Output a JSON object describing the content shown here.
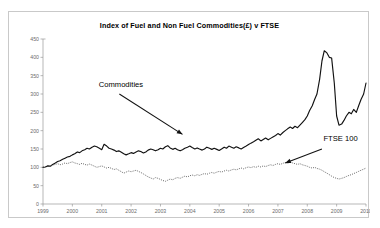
{
  "card": {
    "border_color": "#c9c9c9",
    "background": "#ffffff"
  },
  "chart_data": {
    "type": "line",
    "title": "Index of Fuel and Non Fuel Commodities(£) v FTSE",
    "xlabel": "",
    "ylabel": "",
    "grid": false,
    "legend_position": "inline-annotations",
    "xlim": [
      1999,
      2010
    ],
    "ylim": [
      0,
      450
    ],
    "ytick_step": 50,
    "yticks": [
      0,
      50,
      100,
      150,
      200,
      250,
      300,
      350,
      400,
      450
    ],
    "xticks": [
      1999,
      2000,
      2001,
      2002,
      2003,
      2004,
      2005,
      2006,
      2007,
      2008,
      2009,
      2010
    ],
    "annotations": [
      {
        "text": "Commodities",
        "target_series": "Commodities",
        "arrow": "down-right"
      },
      {
        "text": "FTSE 100",
        "target_series": "FTSE 100",
        "arrow": "down-left"
      }
    ],
    "series": [
      {
        "name": "Commodities",
        "style": "solid",
        "color": "#121212",
        "x": [
          1999.0,
          1999.08,
          1999.17,
          1999.25,
          1999.33,
          1999.42,
          1999.5,
          1999.58,
          1999.67,
          1999.75,
          1999.83,
          1999.92,
          2000.0,
          2000.08,
          2000.17,
          2000.25,
          2000.33,
          2000.42,
          2000.5,
          2000.58,
          2000.67,
          2000.75,
          2000.83,
          2000.92,
          2001.0,
          2001.08,
          2001.17,
          2001.25,
          2001.33,
          2001.42,
          2001.5,
          2001.58,
          2001.67,
          2001.75,
          2001.83,
          2001.92,
          2002.0,
          2002.08,
          2002.17,
          2002.25,
          2002.33,
          2002.42,
          2002.5,
          2002.58,
          2002.67,
          2002.75,
          2002.83,
          2002.92,
          2003.0,
          2003.08,
          2003.17,
          2003.25,
          2003.33,
          2003.42,
          2003.5,
          2003.58,
          2003.67,
          2003.75,
          2003.83,
          2003.92,
          2004.0,
          2004.08,
          2004.17,
          2004.25,
          2004.33,
          2004.42,
          2004.5,
          2004.58,
          2004.67,
          2004.75,
          2004.83,
          2004.92,
          2005.0,
          2005.08,
          2005.17,
          2005.25,
          2005.33,
          2005.42,
          2005.5,
          2005.58,
          2005.67,
          2005.75,
          2005.83,
          2005.92,
          2006.0,
          2006.08,
          2006.17,
          2006.25,
          2006.33,
          2006.42,
          2006.5,
          2006.58,
          2006.67,
          2006.75,
          2006.83,
          2006.92,
          2007.0,
          2007.08,
          2007.17,
          2007.25,
          2007.33,
          2007.42,
          2007.5,
          2007.58,
          2007.67,
          2007.75,
          2007.83,
          2007.92,
          2008.0,
          2008.08,
          2008.17,
          2008.25,
          2008.33,
          2008.42,
          2008.5,
          2008.58,
          2008.67,
          2008.75,
          2008.83,
          2008.92,
          2009.0,
          2009.08,
          2009.17,
          2009.25,
          2009.33,
          2009.42,
          2009.5,
          2009.58,
          2009.67,
          2009.75,
          2009.83,
          2009.92,
          2010.0
        ],
        "values": [
          100,
          101,
          104,
          103,
          108,
          112,
          116,
          118,
          122,
          125,
          128,
          130,
          134,
          137,
          142,
          140,
          145,
          148,
          152,
          150,
          155,
          158,
          156,
          152,
          148,
          163,
          158,
          152,
          150,
          147,
          143,
          145,
          141,
          137,
          134,
          137,
          140,
          138,
          142,
          145,
          143,
          139,
          142,
          147,
          150,
          148,
          145,
          148,
          152,
          150,
          156,
          159,
          153,
          149,
          152,
          148,
          145,
          148,
          152,
          155,
          158,
          154,
          150,
          153,
          150,
          147,
          150,
          155,
          152,
          149,
          152,
          149,
          146,
          150,
          155,
          152,
          158,
          155,
          152,
          156,
          153,
          150,
          154,
          158,
          162,
          166,
          170,
          174,
          178,
          172,
          176,
          180,
          175,
          179,
          183,
          187,
          192,
          188,
          195,
          200,
          205,
          210,
          206,
          212,
          208,
          215,
          222,
          230,
          240,
          255,
          268,
          285,
          300,
          340,
          390,
          418,
          412,
          400,
          398,
          330,
          240,
          215,
          218,
          228,
          240,
          250,
          246,
          258,
          250,
          268,
          285,
          300,
          330
        ]
      },
      {
        "name": "FTSE 100",
        "style": "dotted",
        "color": "#4a4a4a",
        "x": [
          1999.0,
          1999.08,
          1999.17,
          1999.25,
          1999.33,
          1999.42,
          1999.5,
          1999.58,
          1999.67,
          1999.75,
          1999.83,
          1999.92,
          2000.0,
          2000.08,
          2000.17,
          2000.25,
          2000.33,
          2000.42,
          2000.5,
          2000.58,
          2000.67,
          2000.75,
          2000.83,
          2000.92,
          2001.0,
          2001.08,
          2001.17,
          2001.25,
          2001.33,
          2001.42,
          2001.5,
          2001.58,
          2001.67,
          2001.75,
          2001.83,
          2001.92,
          2002.0,
          2002.08,
          2002.17,
          2002.25,
          2002.33,
          2002.42,
          2002.5,
          2002.58,
          2002.67,
          2002.75,
          2002.83,
          2002.92,
          2003.0,
          2003.08,
          2003.17,
          2003.25,
          2003.33,
          2003.42,
          2003.5,
          2003.58,
          2003.67,
          2003.75,
          2003.83,
          2003.92,
          2004.0,
          2004.08,
          2004.17,
          2004.25,
          2004.33,
          2004.42,
          2004.5,
          2004.58,
          2004.67,
          2004.75,
          2004.83,
          2004.92,
          2005.0,
          2005.08,
          2005.17,
          2005.25,
          2005.33,
          2005.42,
          2005.5,
          2005.58,
          2005.67,
          2005.75,
          2005.83,
          2005.92,
          2006.0,
          2006.08,
          2006.17,
          2006.25,
          2006.33,
          2006.42,
          2006.5,
          2006.58,
          2006.67,
          2006.75,
          2006.83,
          2006.92,
          2007.0,
          2007.08,
          2007.17,
          2007.25,
          2007.33,
          2007.42,
          2007.5,
          2007.58,
          2007.67,
          2007.75,
          2007.83,
          2007.92,
          2008.0,
          2008.08,
          2008.17,
          2008.25,
          2008.33,
          2008.42,
          2008.5,
          2008.58,
          2008.67,
          2008.75,
          2008.83,
          2008.92,
          2009.0,
          2009.08,
          2009.17,
          2009.25,
          2009.33,
          2009.42,
          2009.5,
          2009.58,
          2009.67,
          2009.75,
          2009.83,
          2009.92,
          2010.0
        ],
        "values": [
          100,
          102,
          105,
          103,
          106,
          108,
          110,
          107,
          109,
          112,
          110,
          113,
          115,
          112,
          110,
          108,
          111,
          108,
          106,
          109,
          106,
          103,
          100,
          102,
          104,
          101,
          98,
          100,
          97,
          94,
          96,
          92,
          88,
          84,
          87,
          90,
          88,
          90,
          92,
          89,
          86,
          82,
          78,
          74,
          71,
          68,
          72,
          70,
          67,
          64,
          62,
          65,
          68,
          66,
          70,
          72,
          70,
          73,
          76,
          74,
          77,
          79,
          77,
          80,
          78,
          81,
          83,
          81,
          84,
          86,
          84,
          87,
          89,
          87,
          90,
          92,
          90,
          93,
          95,
          93,
          96,
          98,
          96,
          99,
          101,
          99,
          102,
          100,
          103,
          101,
          104,
          102,
          105,
          107,
          105,
          108,
          110,
          108,
          111,
          113,
          111,
          114,
          112,
          110,
          108,
          110,
          107,
          105,
          103,
          100,
          98,
          100,
          97,
          95,
          92,
          88,
          84,
          80,
          76,
          72,
          70,
          68,
          70,
          72,
          75,
          78,
          80,
          83,
          86,
          89,
          92,
          95,
          98
        ]
      }
    ]
  }
}
